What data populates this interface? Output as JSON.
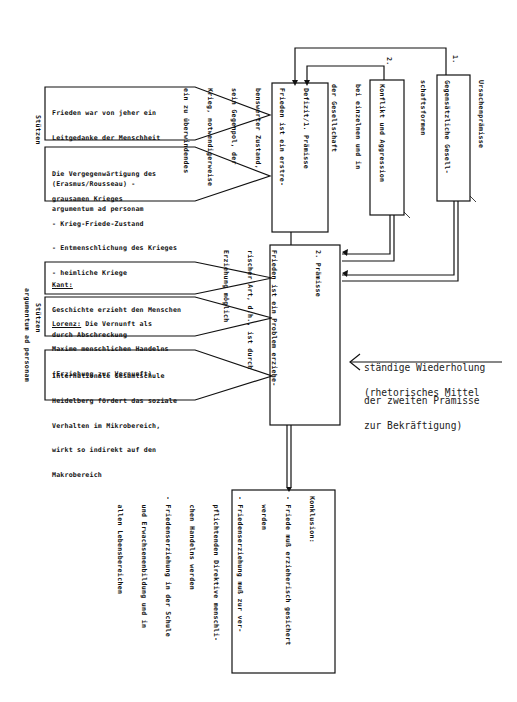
{
  "diagram": {
    "supports_top": {
      "side_label": "Stützen",
      "boxes": [
        {
          "lines": [
            "Frieden war von jeher ein",
            "Leitgedanke der Menschheit",
            "",
            "(Erasmus/Rousseau) -",
            "argumentum ad personam"
          ]
        },
        {
          "lines": [
            "Die Vergegenwärtigung des",
            "grausamen Krieges",
            "- Krieg-Friede-Zustand",
            "- Entmenschlichung des Krieges",
            "- heimliche Kriege"
          ]
        }
      ]
    },
    "supports_bottom": {
      "side_label": "Stützen",
      "side_label_2": "argumentum ad personam",
      "boxes": [
        {
          "heading": "Kant:",
          "lines": [
            "Geschichte erzieht den Menschen",
            "durch Abschreckung"
          ]
        },
        {
          "heading": "Lorenz:",
          "lines": [
            " Die Vernunft als",
            "Maxime menschlichen Handelns",
            "(Erziehung zur Vernunft)"
          ]
        },
        {
          "heading": "",
          "lines": [
            "Internationale Gesamtschule",
            "Heidelberg fördert das soziale",
            "Verhalten im Mikrobereich,",
            "wirkt so indirekt auf den",
            "Makrobereich"
          ]
        }
      ]
    },
    "premise_1": {
      "lines": [
        "Defizit/1. Prämisse",
        "Frieden ist ein erstre-",
        "benswerter Zustand,",
        "sein Gegenpol, der",
        "Krieg, notwendigerweise",
        "ein zu überwindendes"
      ]
    },
    "cause_2": {
      "marker": "2.",
      "lines": [
        "Konflikt und Aggression",
        "bei einzelnen und in",
        "der Gesellschaft"
      ]
    },
    "cause_1": {
      "marker": "1.",
      "label": "Ursachenprämisse",
      "lines": [
        "Gegensätzliche Gesell-",
        "schaftsformen"
      ]
    },
    "premise_2": {
      "lines": [
        "2. Prämisse",
        "",
        "Frieden ist ein Problem erziehe-",
        "rischer Art, d.h., ist durch",
        "Erziehung möglich"
      ]
    },
    "annotation": {
      "line1": "ständige Wiederholung",
      "line2": "der zweiten Prämisse",
      "line3": "(rhetorisches Mittel",
      "line4": "zur Bekräftigung)"
    },
    "conclusion": {
      "lines": [
        "Konklusion:",
        "- Friede muß erzieherisch gesichert",
        "  werden",
        "- Friedenserziehung muß zur ver-",
        "  pflichtenden Direktive menschli-",
        "  chen Handelns werden",
        "- Friedenserziehung in der Schule",
        "  und Erwachsenenbildung und in",
        "  allen Lebensbereichen"
      ]
    },
    "colors": {
      "ink": "#111111",
      "background": "#ffffff"
    }
  }
}
